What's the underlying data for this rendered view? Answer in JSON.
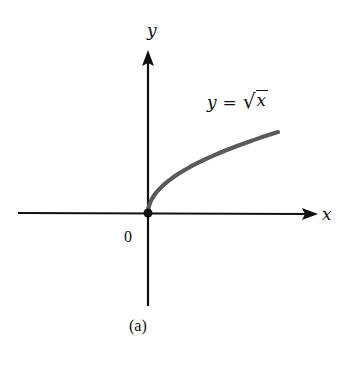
{
  "figure": {
    "caption": "(a)",
    "axes": {
      "x_label": "x",
      "y_label": "y",
      "origin_label": "0"
    },
    "equation": {
      "lhs": "y",
      "equals": "=",
      "radical": "√",
      "radicand": "x",
      "text": "y = √x"
    },
    "colors": {
      "axis": "#111111",
      "curve": "#5a5a5a",
      "origin_dot": "#111111",
      "background": "#ffffff"
    }
  },
  "chart_data": {
    "type": "line",
    "title": "",
    "caption": "(a)",
    "xlabel": "x",
    "ylabel": "y",
    "series": [
      {
        "name": "y = √x",
        "function": "sqrt(x)",
        "domain": "x >= 0",
        "x": [
          0,
          0.25,
          1,
          2.25,
          4,
          6.25,
          9
        ],
        "values": [
          0,
          0.5,
          1,
          1.5,
          2,
          2.5,
          3
        ]
      }
    ],
    "annotations": [
      "y = √x",
      "0"
    ],
    "grid": false,
    "legend": "none",
    "ticks": "none"
  }
}
